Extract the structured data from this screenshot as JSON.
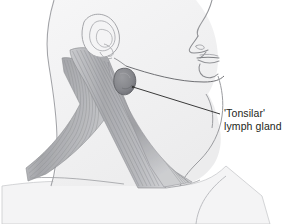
{
  "figure": {
    "type": "anatomical-line-illustration",
    "width": 284,
    "height": 224,
    "background_color": "#ffffff",
    "orientation": "profile facing right"
  },
  "annotation": {
    "label_line_1": "'Tonsilar'",
    "label_line_2": "lymph gland",
    "text_color": "#231f20",
    "leader_line_color": "#3a3a3a",
    "leader_line_target": "tonsillar-lymph-gland"
  },
  "anatomy": {
    "parts": [
      {
        "name": "head-skull",
        "label": "Head",
        "fill": "#f0f0f1",
        "stroke": "#a8a9ad"
      },
      {
        "name": "ear",
        "label": "Ear",
        "fill": "#f2f2f3",
        "stroke": "#a6a7ab"
      },
      {
        "name": "nose",
        "label": "Nose",
        "stroke": "#9b9ca0"
      },
      {
        "name": "lips",
        "label": "Lips",
        "stroke": "#8e8f93"
      },
      {
        "name": "chin",
        "label": "Chin",
        "stroke": "#98999d"
      },
      {
        "name": "jawline",
        "label": "Mandible",
        "stroke": "#7d7e82"
      },
      {
        "name": "neck",
        "label": "Neck",
        "fill": "#f1f1f2",
        "stroke": "#a2a3a7"
      },
      {
        "name": "sternocleidomastoid-muscle",
        "label": "Sternocleidomastoid muscle",
        "fill": "#b6b7bb",
        "stroke": "#8a8b8f"
      },
      {
        "name": "trapezius-muscle",
        "label": "Trapezius muscle",
        "fill": "#bcbdc1",
        "stroke": "#8f9094"
      },
      {
        "name": "tonsillar-lymph-gland",
        "label": "'Tonsilar' lymph gland",
        "fill": "#87888d",
        "stroke": "#5c5d61"
      },
      {
        "name": "shoulder-torso",
        "label": "Shoulder and torso",
        "fill": "#f3f3f4",
        "stroke": "#b9babe"
      }
    ]
  },
  "colors": {
    "paper": "#ffffff",
    "skin_fill": "#f1f1f2",
    "skin_fill_light": "#f6f6f7",
    "outline": "#9c9da1",
    "outline_dark": "#6e6f73",
    "muscle_mid": "#b4b5b9",
    "muscle_dark": "#909196",
    "muscle_light": "#d6d7da",
    "gland_fill": "#87888d",
    "gland_dark": "#5f6064",
    "label_ink": "#231f20"
  }
}
